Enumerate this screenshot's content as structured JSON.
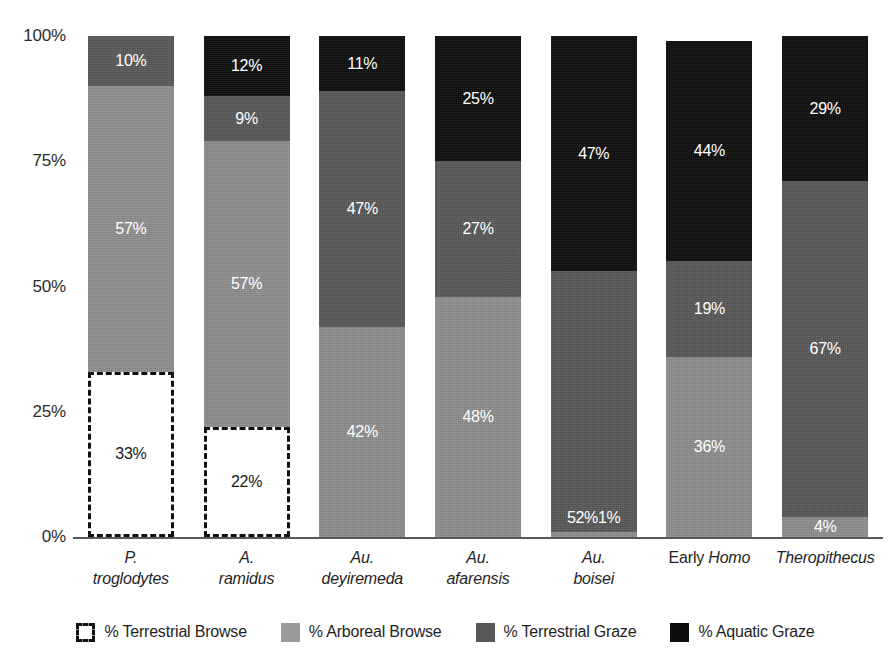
{
  "chart_data": {
    "type": "bar",
    "stacked": true,
    "normalized_percent": true,
    "title": "",
    "xlabel": "",
    "ylabel": "",
    "ylim": [
      0,
      100
    ],
    "ytick_labels": [
      "0%",
      "25%",
      "50%",
      "75%",
      "100%"
    ],
    "yticks": [
      0,
      25,
      50,
      75,
      100
    ],
    "grid": false,
    "legend_position": "bottom",
    "categories": [
      "P. troglodytes",
      "A. ramidus",
      "Au. deyiremeda",
      "Au. afarensis",
      "Au. boisei",
      "Early Homo",
      "Theropithecus"
    ],
    "category_lines": [
      {
        "line1": "P.",
        "line2": "troglodytes",
        "roman_prefix": ""
      },
      {
        "line1": "A.",
        "line2": "ramidus",
        "roman_prefix": ""
      },
      {
        "line1": "Au.",
        "line2": "deyiremeda",
        "roman_prefix": ""
      },
      {
        "line1": "Au.",
        "line2": "afarensis",
        "roman_prefix": ""
      },
      {
        "line1": "Au.",
        "line2": "boisei",
        "roman_prefix": ""
      },
      {
        "line1": "Homo",
        "line2": "",
        "roman_prefix": "Early "
      },
      {
        "line1": "Theropithecus",
        "line2": "",
        "roman_prefix": ""
      }
    ],
    "series": [
      {
        "name": "% Terrestrial Browse",
        "key": "terrestrial-browse",
        "color": "#ffffff",
        "outline": "#111111",
        "values": [
          33,
          22,
          0,
          0,
          0,
          0,
          0
        ]
      },
      {
        "name": "% Arboreal Browse",
        "key": "arboreal-browse",
        "color": "#8e8e8e",
        "values": [
          57,
          57,
          42,
          48,
          1,
          36,
          4
        ]
      },
      {
        "name": "% Terrestrial Graze",
        "key": "terrestrial-graze",
        "color": "#585858",
        "values": [
          10,
          9,
          47,
          27,
          52,
          19,
          67
        ]
      },
      {
        "name": "% Aquatic Graze",
        "key": "aquatic-graze",
        "color": "#0d0d0d",
        "values": [
          0,
          12,
          11,
          25,
          47,
          44,
          29
        ]
      }
    ],
    "bar_labels": [
      [
        {
          "key": "terrestrial-browse",
          "text": "33%",
          "value": 33
        },
        {
          "key": "arboreal-browse",
          "text": "57%",
          "value": 57
        },
        {
          "key": "terrestrial-graze",
          "text": "10%",
          "value": 10
        }
      ],
      [
        {
          "key": "terrestrial-browse",
          "text": "22%",
          "value": 22
        },
        {
          "key": "arboreal-browse",
          "text": "57%",
          "value": 57
        },
        {
          "key": "terrestrial-graze",
          "text": "9%",
          "value": 9
        },
        {
          "key": "aquatic-graze",
          "text": "12%",
          "value": 12
        }
      ],
      [
        {
          "key": "arboreal-browse",
          "text": "42%",
          "value": 42
        },
        {
          "key": "terrestrial-graze",
          "text": "47%",
          "value": 47
        },
        {
          "key": "aquatic-graze",
          "text": "11%",
          "value": 11
        }
      ],
      [
        {
          "key": "arboreal-browse",
          "text": "48%",
          "value": 48
        },
        {
          "key": "terrestrial-graze",
          "text": "27%",
          "value": 27
        },
        {
          "key": "aquatic-graze",
          "text": "25%",
          "value": 25
        }
      ],
      [
        {
          "key": "arboreal-browse",
          "text": "1%",
          "value": 1
        },
        {
          "key": "terrestrial-graze",
          "text": "52%",
          "value": 52
        },
        {
          "key": "aquatic-graze",
          "text": "47%",
          "value": 47
        }
      ],
      [
        {
          "key": "arboreal-browse",
          "text": "36%",
          "value": 36
        },
        {
          "key": "terrestrial-graze",
          "text": "19%",
          "value": 19
        },
        {
          "key": "aquatic-graze",
          "text": "44%",
          "value": 44
        }
      ],
      [
        {
          "key": "arboreal-browse",
          "text": "4%",
          "value": 4
        },
        {
          "key": "terrestrial-graze",
          "text": "67%",
          "value": 67
        },
        {
          "key": "aquatic-graze",
          "text": "29%",
          "value": 29
        }
      ]
    ]
  },
  "y_axis": {
    "ticks": [
      {
        "label": "100%",
        "value": 100
      },
      {
        "label": "75%",
        "value": 75
      },
      {
        "label": "50%",
        "value": 50
      },
      {
        "label": "25%",
        "value": 25
      },
      {
        "label": "0%",
        "value": 0
      }
    ]
  },
  "legend": {
    "items": [
      {
        "label": "% Terrestrial Browse",
        "key": "terrestrial-browse"
      },
      {
        "label": "% Arboreal Browse",
        "key": "arboreal-browse"
      },
      {
        "label": "% Terrestrial Graze",
        "key": "terrestrial-graze"
      },
      {
        "label": "% Aquatic Graze",
        "key": "aquatic-graze"
      }
    ]
  },
  "colors": {
    "terrestrial_browse": "#ffffff",
    "terrestrial_browse_outline": "#111111",
    "arboreal_browse": "#8e8e8e",
    "terrestrial_graze": "#585858",
    "aquatic_graze": "#0d0d0d",
    "axis": "#58595b",
    "text": "#1f1f1f"
  }
}
